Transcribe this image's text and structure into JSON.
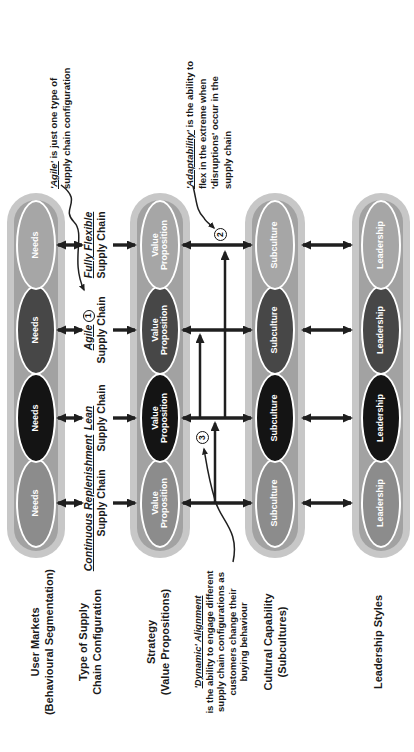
{
  "diagram": {
    "row_labels": {
      "user_markets": {
        "line1": "User Markets",
        "line2": "(Behavioural Segmentation)"
      },
      "supply_config": {
        "line1": "Type of Supply",
        "line2": "Chain Configuration"
      },
      "strategy": {
        "line1": "Strategy",
        "line2": "(Value Propositions)"
      },
      "cultural": {
        "line1": "Cultural Capability",
        "line2": "(Subcultures)"
      },
      "leadership": {
        "line1": "Leadership Styles"
      }
    },
    "cells": {
      "user_markets": "Needs",
      "strategy": "Value Proposition",
      "cultural": "Subculture",
      "leadership": "Leadership"
    },
    "supply_types": {
      "continuous": {
        "name": "Continuous Replenishment",
        "line2": "Supply Chain"
      },
      "lean": {
        "name": "Lean",
        "line2": "Supply Chain"
      },
      "agile": {
        "name": "Agile",
        "line2": "Supply Chain",
        "badge": "1"
      },
      "fully_flexible": {
        "name": "Fully Flexible",
        "line2": "Supply Chain"
      }
    },
    "annotations": {
      "agile": {
        "lead": "'Agile'",
        "lead_rest": " is just one type of",
        "line2": "supply chain configuration"
      },
      "adaptability": {
        "lead": "'Adaptability'",
        "lead_rest": " is the ability to",
        "line2": "flex in the extreme when",
        "line3": "'disruptions' occur in the",
        "line4": "supply chain"
      },
      "dynamic": {
        "lead": "'Dynamic' Alignment",
        "line2": "is the ability to engage different",
        "line3": "supply chain configurations as",
        "line4": "customers change their",
        "line5": "buying behaviour"
      }
    },
    "badges": {
      "one": "1",
      "two": "2",
      "three": "3"
    },
    "colors": {
      "capsule_outer": "#c7c7c7",
      "capsule_inner": "#a2a2a2",
      "continuous": "#8c8c8c",
      "lean": "#141414",
      "agile": "#474747",
      "fully_flexible": "#a6a6a6",
      "ellipse_stroke": "#ffffff",
      "ink": "#1f1f1f"
    }
  }
}
